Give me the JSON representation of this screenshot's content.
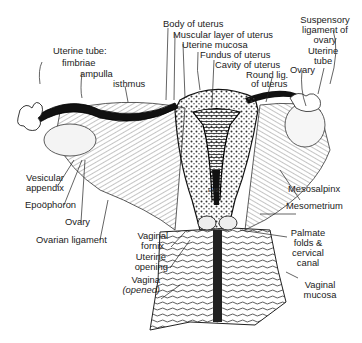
{
  "figure": {
    "signature": "EMS",
    "labels": {
      "uterine_tube_heading": "Uterine tube:",
      "fimbriae": "fimbriae",
      "ampulla": "ampulla",
      "isthmus": "isthmus",
      "body_of_uterus": "Body of uterus",
      "muscular_layer": "Muscular layer of uterus",
      "uterine_mucosa": "Uterine mucosa",
      "fundus": "Fundus of uterus",
      "cavity": "Cavity of uterus",
      "round_lig_1": "Round lig.",
      "round_lig_2": "of uterus",
      "suspensory_1": "Suspensory",
      "suspensory_2": "ligament of",
      "suspensory_3": "ovary",
      "uterine_tube_r_1": "Uterine",
      "uterine_tube_r_2": "tube",
      "ovary_right": "Ovary",
      "vesicular_1": "Vesicular",
      "vesicular_2": "appendix",
      "epoophoron": "Epoöphoron",
      "ovary_left": "Ovary",
      "ovarian_ligament": "Ovarian ligament",
      "mesosalpinx": "Mesosalpinx",
      "mesometrium": "Mesometrium",
      "vaginal_fornix_1": "Vaginal",
      "vaginal_fornix_2": "fornix",
      "uterine_opening_1": "Uterine",
      "uterine_opening_2": "opening",
      "vagina_1": "Vagina",
      "vagina_2": "(opened)",
      "palmate_1": "Palmate",
      "palmate_2": "folds &",
      "palmate_3": "cervical",
      "palmate_4": "canal",
      "vaginal_mucosa_1": "Vaginal",
      "vaginal_mucosa_2": "mucosa"
    }
  }
}
